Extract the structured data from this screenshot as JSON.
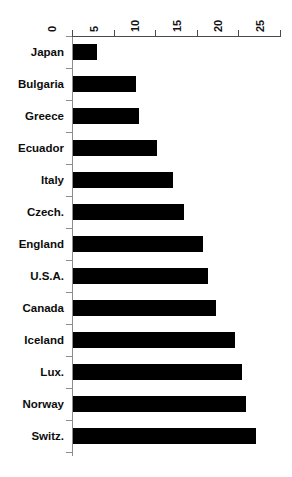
{
  "chart_data": {
    "type": "bar",
    "orientation": "horizontal",
    "title": "",
    "subtitle": "",
    "xlabel": "",
    "ylabel": "",
    "xlim": [
      0,
      25
    ],
    "x_ticks": [
      0,
      5,
      10,
      15,
      20,
      25
    ],
    "x_tick_labels": [
      "0",
      "5",
      "10",
      "15",
      "20",
      "25"
    ],
    "x_axis_position": "top",
    "x_tick_label_rotation": 90,
    "grid": false,
    "legend": null,
    "bar_color": "#000000",
    "axis_color": "#4a4a4a",
    "categories": [
      "Japan",
      "Bulgaria",
      "Greece",
      "Ecuador",
      "Italy",
      "Czech.",
      "England",
      "U.S.A.",
      "Canada",
      "Iceland",
      "Lux.",
      "Norway",
      "Switz."
    ],
    "values": [
      2.9,
      7.6,
      7.9,
      10.1,
      12.0,
      13.3,
      15.6,
      16.2,
      17.2,
      19.5,
      20.3,
      20.8,
      22.0
    ],
    "series": [
      {
        "name": "",
        "values": [
          2.9,
          7.6,
          7.9,
          10.1,
          12.0,
          13.3,
          15.6,
          16.2,
          17.2,
          19.5,
          20.3,
          20.8,
          22.0
        ]
      }
    ]
  }
}
